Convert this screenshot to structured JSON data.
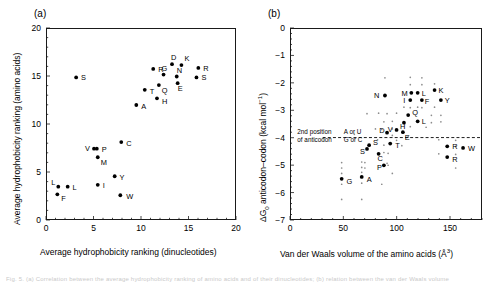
{
  "figure": {
    "width": 495,
    "height": 288,
    "background": "#ffffff",
    "ink_color": "#000000",
    "caption_partial": "Fig. 5. (a) Correlation between the average hydrophobicity ranking of amino acids and of their dinucleotides; (b) relation between the van der Waals volume"
  },
  "panels": [
    {
      "id": "a",
      "label": "(a)",
      "xlabel": "Average hydrophobicity ranking (dinucleotides)",
      "ylabel": "Average hydrophobicity ranking (amino acids)"
    },
    {
      "id": "b",
      "label": "(b)",
      "xlabel_prefix": "Van der Waals volume of the amino acids (Å",
      "xlabel_sup": "3",
      "xlabel_suffix": ")",
      "ylabel_prefix": "ΔG",
      "ylabel_sub": "0",
      "ylabel_mid": " anticodon–codon (kcal mol",
      "ylabel_sup": "−1",
      "ylabel_suffix": ")",
      "annotation_line1_left": "2nd position",
      "annotation_line2_left": "of anticodon",
      "annotation_line1_right": "A or U",
      "annotation_line2_right": "G or C",
      "threshold_value": -4.0
    }
  ],
  "chart_data": [
    {
      "type": "scatter",
      "panel": "a",
      "title": "(a)",
      "xlabel": "Average hydrophobicity ranking (dinucleotides)",
      "ylabel": "Average hydrophobicity ranking (amino acids)",
      "xlim": [
        0,
        20
      ],
      "ylim": [
        0,
        20
      ],
      "xticks": [
        0,
        5,
        10,
        15,
        20
      ],
      "yticks": [
        0,
        5,
        10,
        15,
        20
      ],
      "minor_tick_step": 1,
      "grid": false,
      "legend": "none",
      "points": [
        {
          "label": "S",
          "x": 3.1,
          "y": 14.9,
          "lx": 5,
          "ly": 3
        },
        {
          "label": "R",
          "x": 11.3,
          "y": 15.8,
          "lx": 5,
          "ly": 3
        },
        {
          "label": "D",
          "x": 13.3,
          "y": 16.3,
          "lx": -1,
          "ly": -4
        },
        {
          "label": "K",
          "x": 14.3,
          "y": 16.2,
          "lx": 3,
          "ly": -4
        },
        {
          "label": "R",
          "x": 16.1,
          "y": 15.9,
          "lx": 5,
          "ly": 3
        },
        {
          "label": "G",
          "x": 12.4,
          "y": 15.2,
          "lx": -2,
          "ly": -4
        },
        {
          "label": "N",
          "x": 13.8,
          "y": 15.0,
          "lx": 0,
          "ly": -4
        },
        {
          "label": "S",
          "x": 15.9,
          "y": 14.9,
          "lx": 5,
          "ly": 3
        },
        {
          "label": "E",
          "x": 13.9,
          "y": 14.3,
          "lx": 0,
          "ly": 8
        },
        {
          "label": "Q",
          "x": 11.9,
          "y": 14.1,
          "lx": 3,
          "ly": 8
        },
        {
          "label": "T",
          "x": 10.4,
          "y": 13.6,
          "lx": 5,
          "ly": 4
        },
        {
          "label": "H",
          "x": 11.7,
          "y": 12.7,
          "lx": 5,
          "ly": 6
        },
        {
          "label": "A",
          "x": 9.5,
          "y": 12.0,
          "lx": 5,
          "ly": 4
        },
        {
          "label": "C",
          "x": 7.9,
          "y": 8.1,
          "lx": 5,
          "ly": 4
        },
        {
          "label": "V",
          "x": 5.0,
          "y": 7.4,
          "lx": -9,
          "ly": 2
        },
        {
          "label": "P",
          "x": 5.3,
          "y": 7.4,
          "lx": 5,
          "ly": 3
        },
        {
          "label": "M",
          "x": 5.4,
          "y": 6.5,
          "lx": 3,
          "ly": 8
        },
        {
          "label": "Y",
          "x": 7.2,
          "y": 4.5,
          "lx": 5,
          "ly": 4
        },
        {
          "label": "I",
          "x": 5.4,
          "y": 3.6,
          "lx": 5,
          "ly": 3
        },
        {
          "label": "L",
          "x": 1.2,
          "y": 3.4,
          "lx": -7,
          "ly": -2
        },
        {
          "label": "L",
          "x": 2.2,
          "y": 3.4,
          "lx": 5,
          "ly": 3
        },
        {
          "label": "F",
          "x": 1.1,
          "y": 2.6,
          "lx": 4,
          "ly": 7
        },
        {
          "label": "W",
          "x": 7.8,
          "y": 2.5,
          "lx": 6,
          "ly": 4
        }
      ]
    },
    {
      "type": "scatter",
      "panel": "b",
      "title": "(b)",
      "xlabel": "Van der Waals volume of the amino acids (Å3)",
      "ylabel": "ΔG0 anticodon–codon (kcal mol−1)",
      "xlim": [
        0,
        180
      ],
      "ylim": [
        -7,
        0
      ],
      "xticks": [
        0,
        50,
        100,
        150
      ],
      "yticks": [
        0,
        -1,
        -2,
        -3,
        -4,
        -5,
        -6,
        -7
      ],
      "minor_tick_step": 0.2,
      "grid": false,
      "legend": "none",
      "threshold_line": {
        "y": -4.0,
        "style": "dashed",
        "x_from": 30,
        "x_to": 180
      },
      "annotations": [
        {
          "text": "2nd position",
          "x": 6,
          "y": -3.88,
          "anchor": "start"
        },
        {
          "text": "of anticodon",
          "x": 6,
          "y": -4.18,
          "anchor": "start"
        },
        {
          "text": "A or U",
          "x": 50,
          "y": -3.88,
          "anchor": "start"
        },
        {
          "text": "G or C",
          "x": 50,
          "y": -4.18,
          "anchor": "start"
        }
      ],
      "points_major": [
        {
          "label": "N",
          "x": 89,
          "y": -2.45,
          "lx": -11,
          "ly": 3
        },
        {
          "label": "M",
          "x": 114,
          "y": -2.35,
          "lx": -10,
          "ly": 3
        },
        {
          "label": "L",
          "x": 120,
          "y": -2.35,
          "lx": 4,
          "ly": 3
        },
        {
          "label": "K",
          "x": 136,
          "y": -2.25,
          "lx": 4,
          "ly": 3
        },
        {
          "label": "I",
          "x": 113,
          "y": -2.62,
          "lx": -7,
          "ly": 3
        },
        {
          "label": "F",
          "x": 124,
          "y": -2.62,
          "lx": 3,
          "ly": 4
        },
        {
          "label": "Y",
          "x": 142,
          "y": -2.62,
          "lx": 4,
          "ly": 3
        },
        {
          "label": "Q",
          "x": 111,
          "y": -3.17,
          "lx": 4,
          "ly": 0
        },
        {
          "label": "H",
          "x": 107,
          "y": -3.45,
          "lx": -4,
          "ly": 6
        },
        {
          "label": "L",
          "x": 120,
          "y": -3.4,
          "lx": 4,
          "ly": 3
        },
        {
          "label": "V",
          "x": 100,
          "y": -3.72,
          "lx": -9,
          "ly": 2
        },
        {
          "label": "E",
          "x": 106,
          "y": -3.8,
          "lx": 2,
          "ly": 8
        },
        {
          "label": "D",
          "x": 91,
          "y": -3.82,
          "lx": -8,
          "ly": 0
        },
        {
          "label": "T",
          "x": 94,
          "y": -4.22,
          "lx": 5,
          "ly": 4
        },
        {
          "label": "S",
          "x": 74,
          "y": -4.28,
          "lx": 4,
          "ly": 0
        },
        {
          "label": "S",
          "x": 72,
          "y": -4.42,
          "lx": -7,
          "ly": 5
        },
        {
          "label": "C",
          "x": 83,
          "y": -4.6,
          "lx": -1,
          "ly": 7
        },
        {
          "label": "R",
          "x": 148,
          "y": -4.32,
          "lx": 5,
          "ly": 3
        },
        {
          "label": "W",
          "x": 163,
          "y": -4.38,
          "lx": 5,
          "ly": 3
        },
        {
          "label": "R",
          "x": 148,
          "y": -4.72,
          "lx": 5,
          "ly": 5
        },
        {
          "label": "P",
          "x": 88,
          "y": -5.02,
          "lx": -7,
          "ly": 5
        },
        {
          "label": "G",
          "x": 48,
          "y": -5.52,
          "lx": 5,
          "ly": 5
        },
        {
          "label": "A",
          "x": 67,
          "y": -5.45,
          "lx": 5,
          "ly": 5
        }
      ],
      "points_minor": [
        {
          "x": 89,
          "y": -1.8
        },
        {
          "x": 113,
          "y": -1.78
        },
        {
          "x": 124,
          "y": -1.8
        },
        {
          "x": 113,
          "y": -2.05
        },
        {
          "x": 124,
          "y": -2.05
        },
        {
          "x": 136,
          "y": -2.02
        },
        {
          "x": 107,
          "y": -2.88
        },
        {
          "x": 113,
          "y": -2.9
        },
        {
          "x": 120,
          "y": -2.88
        },
        {
          "x": 124,
          "y": -2.9
        },
        {
          "x": 136,
          "y": -2.88
        },
        {
          "x": 72,
          "y": -3.12
        },
        {
          "x": 83,
          "y": -3.1
        },
        {
          "x": 91,
          "y": -3.12
        },
        {
          "x": 100,
          "y": -3.1
        },
        {
          "x": 133,
          "y": -3.18
        },
        {
          "x": 142,
          "y": -3.18
        },
        {
          "x": 88,
          "y": -3.42
        },
        {
          "x": 96,
          "y": -3.4
        },
        {
          "x": 133,
          "y": -3.45
        },
        {
          "x": 142,
          "y": -3.42
        },
        {
          "x": 80,
          "y": -3.68
        },
        {
          "x": 86,
          "y": -3.7
        },
        {
          "x": 96,
          "y": -3.68
        },
        {
          "x": 113,
          "y": -3.6
        },
        {
          "x": 128,
          "y": -3.62
        },
        {
          "x": 60,
          "y": -3.88
        },
        {
          "x": 96,
          "y": -3.92
        },
        {
          "x": 111,
          "y": -3.95
        },
        {
          "x": 82,
          "y": -4.08
        },
        {
          "x": 100,
          "y": -4.1
        },
        {
          "x": 140,
          "y": -4.08
        },
        {
          "x": 156,
          "y": -4.1
        },
        {
          "x": 88,
          "y": -4.28
        },
        {
          "x": 105,
          "y": -4.3
        },
        {
          "x": 156,
          "y": -4.32
        },
        {
          "x": 88,
          "y": -4.55
        },
        {
          "x": 92,
          "y": -4.58
        },
        {
          "x": 140,
          "y": -4.6
        },
        {
          "x": 156,
          "y": -4.62
        },
        {
          "x": 48,
          "y": -4.92
        },
        {
          "x": 67,
          "y": -4.9
        },
        {
          "x": 70,
          "y": -4.92
        },
        {
          "x": 91,
          "y": -4.95
        },
        {
          "x": 48,
          "y": -5.12
        },
        {
          "x": 67,
          "y": -5.1
        },
        {
          "x": 70,
          "y": -5.12
        },
        {
          "x": 92,
          "y": -5.02
        },
        {
          "x": 156,
          "y": -5.12
        },
        {
          "x": 48,
          "y": -5.32
        },
        {
          "x": 67,
          "y": -5.28
        },
        {
          "x": 48,
          "y": -5.72
        },
        {
          "x": 67,
          "y": -5.68
        },
        {
          "x": 86,
          "y": -5.72
        },
        {
          "x": 96,
          "y": -5.32
        },
        {
          "x": 48,
          "y": -6.28
        },
        {
          "x": 67,
          "y": -6.28
        }
      ]
    }
  ]
}
